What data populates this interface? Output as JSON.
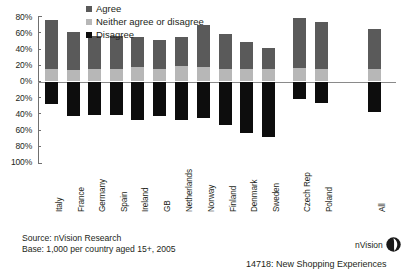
{
  "chart_data": {
    "type": "bar",
    "title": "",
    "subtitle": "",
    "xlabel": "",
    "ylabel": "",
    "ylim": [
      -100,
      80
    ],
    "grid": false,
    "stacked": true,
    "orientation": "diverging",
    "legend_position": "top-center",
    "ytick_labels": [
      "80%",
      "60%",
      "40%",
      "20%",
      "0%",
      "20%",
      "40%",
      "60%",
      "80%",
      "100%"
    ],
    "ytick_values": [
      80,
      60,
      40,
      20,
      0,
      -20,
      -40,
      -60,
      -80,
      -100
    ],
    "categories": [
      "Italy",
      "France",
      "Germany",
      "Spain",
      "Ireland",
      "GB",
      "Netherlands",
      "Norway",
      "Finland",
      "Denmark",
      "Sweden",
      "Czech Rep",
      "Poland",
      "All"
    ],
    "series": [
      {
        "name": "Agree",
        "color": "#5a5a5a",
        "values": [
          60,
          47,
          41,
          41,
          37,
          36,
          36,
          52,
          44,
          34,
          26,
          62,
          58,
          49
        ]
      },
      {
        "name": "Neither agree or disagree",
        "color": "#b7b7b7",
        "values": [
          16,
          14,
          15,
          15,
          18,
          15,
          19,
          18,
          15,
          15,
          15,
          17,
          16,
          16
        ]
      },
      {
        "name": "Disagree",
        "color": "#0d0d0d",
        "values": [
          -28,
          -42,
          -41,
          -41,
          -48,
          -42,
          -47,
          -45,
          -54,
          -63,
          -68,
          -22,
          -26,
          -38
        ]
      }
    ],
    "annotations": []
  },
  "legend": {
    "items": [
      {
        "label": "Agree",
        "color": "#5a5a5a",
        "swatch": "square-swatch"
      },
      {
        "label": "Neither agree or disagree",
        "color": "#b7b7b7",
        "swatch": "square-swatch"
      },
      {
        "label": "Disagree",
        "color": "#0d0d0d",
        "swatch": "square-swatch"
      }
    ]
  },
  "footer": {
    "source": "Source: nVision Research",
    "base": "Base: 1,000 per country aged 15+, 2005"
  },
  "branding": {
    "logo_text": "nVision",
    "logo_icon": "nvision-leaf-logo"
  },
  "slide": {
    "id_and_title": "14718: New Shopping Experiences"
  }
}
